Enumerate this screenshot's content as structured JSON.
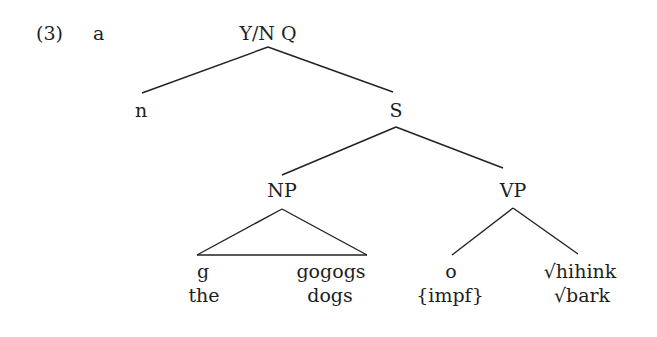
{
  "example": {
    "number": "(3)",
    "letter": "a"
  },
  "tree": {
    "root": "Y/N Q",
    "nodes": {
      "n": "n",
      "S": "S",
      "NP": "NP",
      "VP": "VP"
    },
    "leaves": [
      {
        "form": "g",
        "gloss": "the"
      },
      {
        "form": "gogogs",
        "gloss": "dogs"
      },
      {
        "form": "o",
        "gloss": "{impf}"
      },
      {
        "form": "√hihink",
        "gloss": "√bark"
      }
    ],
    "structure": "[Y/N Q n [S [NP(triangle) g gogogs] [VP o √hihink]]]"
  }
}
